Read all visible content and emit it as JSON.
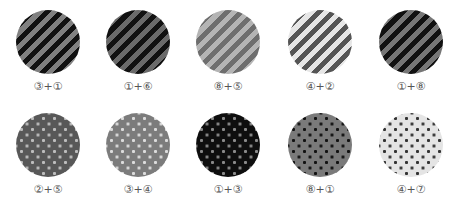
{
  "rows": [
    {
      "pattern": "stripes",
      "items": [
        {
          "label": "③+①",
          "c1": "#808080",
          "c2": "#111111"
        },
        {
          "label": "①+⑥",
          "c1": "#111111",
          "c2": "#6a6a6a"
        },
        {
          "label": "⑧+⑤",
          "c1": "#b4b4b4",
          "c2": "#6e6e6e"
        },
        {
          "label": "④+②",
          "c1": "#e6e6e6",
          "c2": "#555555"
        },
        {
          "label": "①+⑧",
          "c1": "#111111",
          "c2": "#767676"
        }
      ]
    },
    {
      "pattern": "dots",
      "items": [
        {
          "label": "②+⑤",
          "bg": "#585858",
          "dot": "#bdbdbd"
        },
        {
          "label": "③+④",
          "bg": "#7c7c7c",
          "dot": "#dcdcdc"
        },
        {
          "label": "①+③",
          "bg": "#0e0e0e",
          "dot": "#8a8a8a"
        },
        {
          "label": "⑧+①",
          "bg": "#7a7a7a",
          "dot": "#111111"
        },
        {
          "label": "④+⑦",
          "bg": "#e4e4e4",
          "dot": "#333333"
        }
      ]
    }
  ]
}
